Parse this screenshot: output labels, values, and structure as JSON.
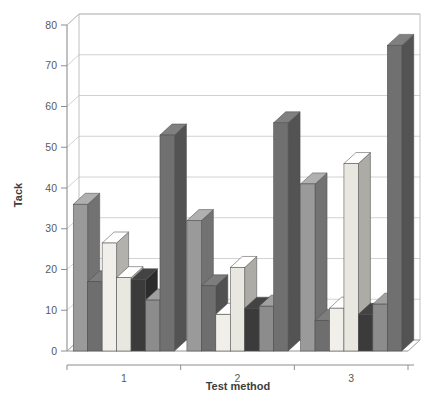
{
  "chart_data": {
    "type": "bar",
    "title": "",
    "subtitle": "",
    "xlabel": "Test method",
    "ylabel": "Tack",
    "categories": [
      "1",
      "2",
      "3"
    ],
    "ylim": [
      0,
      80
    ],
    "yticks": [
      0,
      10,
      20,
      30,
      40,
      50,
      60,
      70,
      80
    ],
    "grid": true,
    "legend": "none",
    "style": "3d-grouped-bars-grayscale",
    "series": [
      {
        "name": "Series 1",
        "color": "#9a9a9a",
        "values": [
          36,
          32,
          41
        ]
      },
      {
        "name": "Series 2",
        "color": "#6e6e6e",
        "values": [
          17,
          16,
          7.5
        ]
      },
      {
        "name": "Series 3",
        "color": "#f0efe9",
        "values": [
          26.5,
          9,
          10.5
        ]
      },
      {
        "name": "Series 4",
        "color": "#e8e7e0",
        "values": [
          18,
          20.5,
          46
        ]
      },
      {
        "name": "Series 5",
        "color": "#3b3b3b",
        "values": [
          17.5,
          10.5,
          9
        ]
      },
      {
        "name": "Series 6",
        "color": "#8c8c8c",
        "values": [
          12.5,
          11,
          11.5
        ]
      },
      {
        "name": "Series 7",
        "color": "#707070",
        "values": [
          53,
          56,
          75
        ]
      }
    ]
  },
  "axes": {
    "y_tick_labels": [
      "0",
      "10",
      "20",
      "30",
      "40",
      "50",
      "60",
      "70",
      "80"
    ],
    "x_tick_labels": [
      "1",
      "2",
      "3"
    ],
    "y_axis_title": "Tack",
    "x_axis_title": "Test method"
  }
}
